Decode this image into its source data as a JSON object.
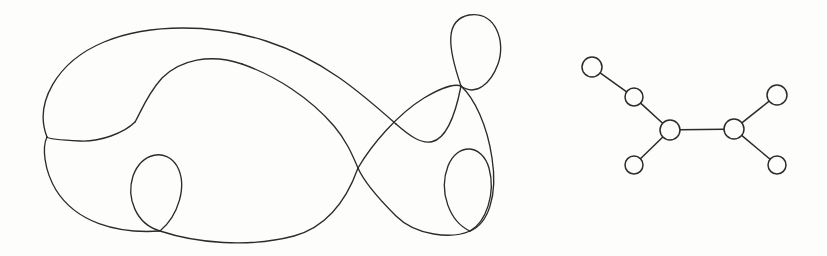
{
  "figure": {
    "background_color": "#fdfdfc",
    "ink_color": "#2b2b2b",
    "width": 827,
    "height": 256,
    "panels": [
      {
        "id": "curve-panel",
        "name": "self-intersecting-closed-curve"
      },
      {
        "id": "graph-panel",
        "name": "tree-graph"
      }
    ]
  },
  "curve": {
    "name": "closed-curve-with-self-intersections",
    "stroke_color": "#2b2b2b",
    "stroke_width": 1.35,
    "closed": true,
    "crossing_count": 6,
    "crossings": [
      {
        "label": "left-figure-eight-outer",
        "x": 47,
        "y": 138
      },
      {
        "label": "left-figure-eight-inner",
        "x": 135,
        "y": 122
      },
      {
        "label": "bottom-left-teardrop",
        "x": 160,
        "y": 230
      },
      {
        "label": "center-main",
        "x": 358,
        "y": 168
      },
      {
        "label": "top-right-loop",
        "x": 462,
        "y": 85
      },
      {
        "label": "bottom-right-loop",
        "x": 470,
        "y": 230
      }
    ],
    "path": "M 47 138 C 36 112 48 66 92 44 C 140 21 215 22 268 38 C 330 57 378 96 420 128 C 436 141 450 152 462 85 C 448 46 446 22 470 16 C 496 10 505 40 498 62 C 492 82 478 96 462 85 C 444 73 420 118 400 148 C 378 182 360 206 330 224 C 296 244 252 246 214 238 C 190 233 172 233 160 230 C 131 223 124 198 131 177 C 139 154 160 146 172 160 C 184 174 178 200 168 215 C 160 227 153 229 160 230 C 176 233 214 240 248 240 C 300 240 352 216 400 186 C 430 167 452 150 470 230 C 480 243 500 236 500 200 C 500 168 486 148 470 155 C 452 163 442 190 452 212 C 460 230 466 232 470 230 C 478 228 486 210 490 186 C 496 150 488 118 462 85 C 440 57 402 32 358 168 C 330 106 290 78 248 64 C 212 52 176 62 158 82 C 140 101 140 118 135 122 C 126 130 104 140 84 140 C 62 140 52 140 47 138 C 42 137 40 146 44 160 C 52 190 72 208 104 214 C 136 220 152 226 160 230 C 180 240 218 248 248 248 C 300 248 350 224 392 192 C 428 164 452 130 462 85",
    "segments": [
      {
        "name": "outer-large-lobe-upper",
        "d": "M 47 137 C 34 104 56 62 104 42 C 150 23 214 24 266 41 C 322 59 360 92 396 124"
      },
      {
        "name": "upper-right-rise-to-crossing",
        "d": "M 396 124 C 420 145 446 163 461 86"
      },
      {
        "name": "top-teardrop-loop",
        "d": "M 461 86 C 448 48 444 20 469 15 C 496 11 506 42 498 64 C 491 83 476 97 461 86"
      },
      {
        "name": "descent-right-of-top-loop",
        "d": "M 461 86 C 474 98 487 124 492 158 C 498 196 488 224 470 231"
      },
      {
        "name": "bottom-right-inner-loop",
        "d": "M 470 231 C 450 222 438 192 448 166 C 458 142 482 144 489 168 C 496 194 486 222 470 231"
      },
      {
        "name": "bottom-right-outer-return",
        "d": "M 470 231 C 452 239 416 236 396 216 C 378 198 364 182 358 168"
      },
      {
        "name": "center-crossing-to-upper-left",
        "d": "M 358 168 C 352 154 346 140 334 126 C 310 98 276 76 242 64"
      },
      {
        "name": "small-figure-eight-right-lobe",
        "d": "M 242 64 C 210 53 180 60 162 78 C 146 96 140 114 135 122"
      },
      {
        "name": "small-figure-eight-left-lobe",
        "d": "M 135 122 C 124 133 100 142 80 141 C 58 140 48 139 47 137"
      },
      {
        "name": "left-outer-descending",
        "d": "M 47 137 C 42 147 44 170 56 190 C 76 222 116 234 160 231"
      },
      {
        "name": "bottom-left-teardrop",
        "d": "M 160 231 C 136 224 126 198 133 176 C 142 152 166 148 177 166 C 188 186 178 216 160 231"
      },
      {
        "name": "bottom-return-to-center",
        "d": "M 160 231 C 196 243 248 248 294 236 C 330 226 348 196 358 168"
      },
      {
        "name": "center-crossing-to-top-loop",
        "d": "M 358 168 C 372 144 398 114 424 98 C 444 86 456 84 461 86"
      }
    ]
  },
  "graph": {
    "name": "tree-graph-seven-nodes",
    "node_count": 7,
    "edge_count": 6,
    "node_fill": "#fdfdfc",
    "node_stroke": "#2b2b2b",
    "node_stroke_width": 1.5,
    "nodes": [
      {
        "id": "n1",
        "label": "top-left-leaf",
        "x": 592,
        "y": 67,
        "r": 10,
        "degree": 1
      },
      {
        "id": "n2",
        "label": "upper-mid",
        "x": 634,
        "y": 97,
        "r": 9,
        "degree": 2
      },
      {
        "id": "n3",
        "label": "left-junction",
        "x": 670,
        "y": 130,
        "r": 10,
        "degree": 3
      },
      {
        "id": "n4",
        "label": "lower-left-leaf",
        "x": 634,
        "y": 165,
        "r": 9,
        "degree": 1
      },
      {
        "id": "n5",
        "label": "right-junction",
        "x": 734,
        "y": 129,
        "r": 10,
        "degree": 3
      },
      {
        "id": "n6",
        "label": "upper-right-leaf",
        "x": 777,
        "y": 95,
        "r": 10,
        "degree": 1
      },
      {
        "id": "n7",
        "label": "lower-right-leaf",
        "x": 777,
        "y": 165,
        "r": 9,
        "degree": 1
      }
    ],
    "edges": [
      {
        "from": "n1",
        "to": "n2",
        "label": "edge-topleaf-uppermid"
      },
      {
        "from": "n2",
        "to": "n3",
        "label": "edge-uppermid-leftjunction"
      },
      {
        "from": "n3",
        "to": "n4",
        "label": "edge-leftjunction-lowerleftleaf"
      },
      {
        "from": "n3",
        "to": "n5",
        "label": "edge-leftjunction-rightjunction"
      },
      {
        "from": "n5",
        "to": "n6",
        "label": "edge-rightjunction-upperrightleaf"
      },
      {
        "from": "n5",
        "to": "n7",
        "label": "edge-rightjunction-lowerrightleaf"
      }
    ]
  }
}
